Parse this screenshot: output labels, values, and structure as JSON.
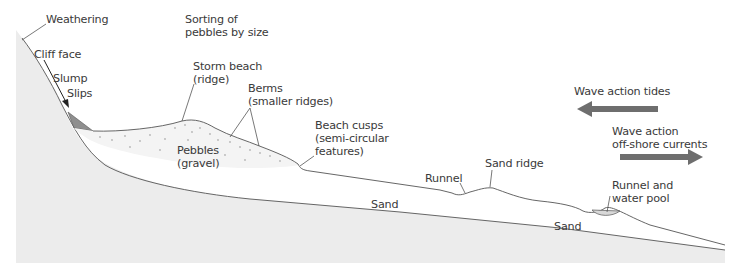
{
  "diagram": {
    "colors": {
      "bedrock": "#ececec",
      "line": "#555555",
      "slump": "#8f8f8f",
      "arrow": "#6e6e6e",
      "text": "#3a3a3a",
      "pebbles": "#bdbdbd"
    },
    "labels": {
      "weathering": "Weathering",
      "sorting": "Sorting of\npebbles by size",
      "cliff_face": "Cliff face",
      "slump": "Slump",
      "slips": "Slips",
      "storm_beach": "Storm beach\n(ridge)",
      "berms": "Berms\n(smaller ridges)",
      "pebbles": "Pebbles\n(gravel)",
      "beach_cusps": "Beach cusps\n(semi-circular\nfeatures)",
      "runnel": "Runnel",
      "sand_ridge": "Sand ridge",
      "runnel_pool": "Runnel and\nwater pool",
      "sand_upper": "Sand",
      "sand_lower": "Sand",
      "wave_tides": "Wave action tides",
      "wave_offshore": "Wave action\noff-shore currents"
    },
    "arrows": [
      {
        "name": "wave-action-tides",
        "direction": "left"
      },
      {
        "name": "wave-action-offshore",
        "direction": "right"
      }
    ]
  }
}
